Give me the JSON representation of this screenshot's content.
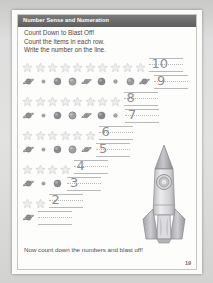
{
  "worksheet": {
    "header_title": "Number Sense and Numeration",
    "activity_title": "Count Down to Blast Off!",
    "instructions": [
      "Count the items in each row.",
      "Write the number on the line."
    ],
    "footer_text": "Now count down the numbers and blast off!",
    "page_number": "19",
    "illustration": "rocket-icon"
  },
  "colors": {
    "header_band": "#6f6f6f",
    "header_text": "#ffffff",
    "body_text": "#4a4a4a",
    "handwriting": "#8d8d90",
    "line": "#b9b9bb",
    "star": "#cfcfd2",
    "planet": "#9a9a9d",
    "page_bg": "#fdfdfc",
    "outer_bg": "#d8d8d6"
  },
  "rows": [
    {
      "item_type": "star",
      "count": 10,
      "answer": "10"
    },
    {
      "item_type": "planet",
      "count": 9,
      "answer": "9"
    },
    {
      "item_type": "star",
      "count": 8,
      "answer": "8"
    },
    {
      "item_type": "planet",
      "count": 7,
      "answer": "7"
    },
    {
      "item_type": "star",
      "count": 6,
      "answer": "6"
    },
    {
      "item_type": "planet",
      "count": 5,
      "answer": "5"
    },
    {
      "item_type": "star",
      "count": 4,
      "answer": "4"
    },
    {
      "item_type": "planet",
      "count": 3,
      "answer": "3"
    },
    {
      "item_type": "star",
      "count": 2,
      "answer": "2"
    },
    {
      "item_type": "planet",
      "count": 1,
      "answer": ""
    }
  ],
  "chart_data": {
    "type": "table",
    "title": "Count Down to Blast Off!",
    "categories": [
      "Row 1",
      "Row 2",
      "Row 3",
      "Row 4",
      "Row 5",
      "Row 6",
      "Row 7",
      "Row 8",
      "Row 9",
      "Row 10"
    ],
    "values": [
      10,
      9,
      8,
      7,
      6,
      5,
      4,
      3,
      2,
      1
    ],
    "xlabel": "Row",
    "ylabel": "Item count"
  }
}
